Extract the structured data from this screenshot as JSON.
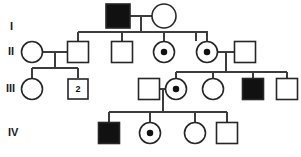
{
  "figure": {
    "type": "pedigree-chart",
    "width": 301,
    "height": 157,
    "background_color": "#ffffff",
    "line_color": "#3c3c3c",
    "symbol_stroke_color": "#262626",
    "affected_fill_color": "#111111",
    "unaffected_fill_color": "#ffffff"
  },
  "generation_labels": [
    {
      "id": "gen-label-1",
      "text": "I",
      "x": 10,
      "y": 27
    },
    {
      "id": "gen-label-2",
      "text": "II",
      "x": 8,
      "y": 52
    },
    {
      "id": "gen-label-3",
      "text": "III",
      "x": 6,
      "y": 89
    },
    {
      "id": "gen-label-4",
      "text": "IV",
      "x": 8,
      "y": 133
    }
  ],
  "legend_text": {
    "square": "male",
    "circle": "female",
    "filled": "affected",
    "dotted": "carrier"
  },
  "individuals": [
    {
      "id": "I-1",
      "generation": "I",
      "sex": "male",
      "status": "affected",
      "cx": 118,
      "cy": 16,
      "size": 24
    },
    {
      "id": "I-2",
      "generation": "I",
      "sex": "female",
      "status": "unaffected",
      "cx": 164,
      "cy": 16,
      "size": 24
    },
    {
      "id": "II-1",
      "generation": "II",
      "sex": "female",
      "status": "unaffected",
      "cx": 32,
      "cy": 52,
      "size": 21
    },
    {
      "id": "II-2",
      "generation": "II",
      "sex": "male",
      "status": "unaffected",
      "cx": 78,
      "cy": 52,
      "size": 21
    },
    {
      "id": "II-3",
      "generation": "II",
      "sex": "male",
      "status": "unaffected",
      "cx": 122,
      "cy": 52,
      "size": 21
    },
    {
      "id": "II-4",
      "generation": "II",
      "sex": "female",
      "status": "carrier",
      "cx": 164,
      "cy": 52,
      "size": 21
    },
    {
      "id": "II-5",
      "generation": "II",
      "sex": "female",
      "status": "carrier",
      "cx": 207,
      "cy": 52,
      "size": 21
    },
    {
      "id": "II-6",
      "generation": "II",
      "sex": "male",
      "status": "unaffected",
      "cx": 245,
      "cy": 52,
      "size": 21
    },
    {
      "id": "III-1",
      "generation": "III",
      "sex": "female",
      "status": "unaffected",
      "cx": 32,
      "cy": 89,
      "size": 21
    },
    {
      "id": "III-2",
      "generation": "III",
      "sex": "male",
      "status": "unaffected",
      "cx": 78,
      "cy": 89,
      "size": 20,
      "label": "2"
    },
    {
      "id": "III-3",
      "generation": "III",
      "sex": "male",
      "status": "unaffected",
      "cx": 149,
      "cy": 89,
      "size": 21
    },
    {
      "id": "III-4",
      "generation": "III",
      "sex": "female",
      "status": "carrier",
      "cx": 176,
      "cy": 89,
      "size": 21
    },
    {
      "id": "III-5",
      "generation": "III",
      "sex": "female",
      "status": "unaffected",
      "cx": 213,
      "cy": 89,
      "size": 21
    },
    {
      "id": "III-6",
      "generation": "III",
      "sex": "male",
      "status": "affected",
      "cx": 253,
      "cy": 89,
      "size": 21
    },
    {
      "id": "III-7",
      "generation": "III",
      "sex": "male",
      "status": "unaffected",
      "cx": 287,
      "cy": 89,
      "size": 21
    },
    {
      "id": "IV-1",
      "generation": "IV",
      "sex": "male",
      "status": "affected",
      "cx": 109,
      "cy": 133,
      "size": 21
    },
    {
      "id": "IV-2",
      "generation": "IV",
      "sex": "female",
      "status": "carrier",
      "cx": 150,
      "cy": 133,
      "size": 21
    },
    {
      "id": "IV-3",
      "generation": "IV",
      "sex": "female",
      "status": "unaffected",
      "cx": 195,
      "cy": 133,
      "size": 21
    },
    {
      "id": "IV-4",
      "generation": "IV",
      "sex": "male",
      "status": "unaffected",
      "cx": 227,
      "cy": 133,
      "size": 21
    }
  ],
  "connections": [
    {
      "id": "mating-I-1-I-2",
      "type": "mating",
      "points": "130,16 152,16"
    },
    {
      "id": "descent-I",
      "type": "descent",
      "points": "141,16 141,32"
    },
    {
      "id": "sibline-gen-II",
      "type": "sibship",
      "points": "78,32 196,32"
    },
    {
      "id": "drop-II-2",
      "type": "drop",
      "points": "78,32 78,41"
    },
    {
      "id": "drop-II-3",
      "type": "drop",
      "points": "122,32 122,41"
    },
    {
      "id": "drop-II-4",
      "type": "drop",
      "points": "164,32 164,41"
    },
    {
      "id": "drop-II-5",
      "type": "drop",
      "points": "196,32 196,41"
    },
    {
      "id": "branch-II-5",
      "type": "descent",
      "points": "196,32 207,32 207,41"
    },
    {
      "id": "mating-II-1-II-2",
      "type": "mating",
      "points": "43,52 67,52"
    },
    {
      "id": "descent-II-1-2",
      "type": "descent",
      "points": "55,52 55,68"
    },
    {
      "id": "sibline-gen-III-L",
      "type": "sibship",
      "points": "32,68 78,68"
    },
    {
      "id": "drop-III-1",
      "type": "drop",
      "points": "32,68 32,78"
    },
    {
      "id": "drop-III-2",
      "type": "drop",
      "points": "78,68 78,78"
    },
    {
      "id": "mating-II-5-II-6",
      "type": "mating",
      "points": "218,52 234,52"
    },
    {
      "id": "descent-II-5-6",
      "type": "descent",
      "points": "226,52 226,72"
    },
    {
      "id": "sibline-gen-III-R",
      "type": "sibship",
      "points": "176,72 287,72"
    },
    {
      "id": "drop-III-4",
      "type": "drop",
      "points": "176,72 176,78"
    },
    {
      "id": "drop-III-5",
      "type": "drop",
      "points": "213,72 213,78"
    },
    {
      "id": "drop-III-6",
      "type": "drop",
      "points": "253,72 253,78"
    },
    {
      "id": "drop-III-7",
      "type": "drop",
      "points": "287,72 287,78"
    },
    {
      "id": "mating-III-3-III-4",
      "type": "mating",
      "points": "160,89 166,89"
    },
    {
      "id": "descent-III-3-4",
      "type": "descent",
      "points": "163,89 163,112"
    },
    {
      "id": "sibline-gen-IV",
      "type": "sibship",
      "points": "109,112 227,112"
    },
    {
      "id": "drop-IV-1",
      "type": "drop",
      "points": "109,112 109,122"
    },
    {
      "id": "drop-IV-2",
      "type": "drop",
      "points": "150,112 150,122"
    },
    {
      "id": "drop-IV-3",
      "type": "drop",
      "points": "195,112 195,122"
    },
    {
      "id": "drop-IV-4",
      "type": "drop",
      "points": "227,112 227,122"
    }
  ]
}
